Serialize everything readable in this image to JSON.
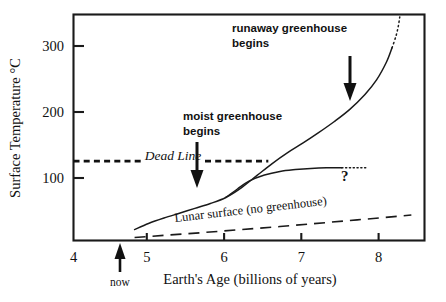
{
  "chart_data": {
    "type": "line",
    "title": "",
    "xlabel": "Earth's Age (billions of years)",
    "ylabel": "Surface Temperature °C",
    "xlim": [
      3.83,
      8.37
    ],
    "ylim": [
      -3,
      370
    ],
    "grid": false,
    "legend": "none",
    "xticks": [
      4,
      5,
      6,
      7,
      8
    ],
    "xticklabels": [
      "4",
      "5",
      "6",
      "7",
      "8"
    ],
    "yticks": [
      100,
      200,
      300
    ],
    "yticklabels": [
      "100",
      "200",
      "300"
    ],
    "series": [
      {
        "name": "Earth surface temperature (greenhouse)",
        "style": "solid",
        "points": [
          [
            4.62,
            15
          ],
          [
            4.8,
            25
          ],
          [
            5.0,
            34
          ],
          [
            5.2,
            42
          ],
          [
            5.4,
            50
          ],
          [
            5.6,
            58
          ],
          [
            5.8,
            68
          ],
          [
            6.0,
            84
          ],
          [
            6.2,
            104
          ],
          [
            6.4,
            124
          ],
          [
            6.6,
            142
          ],
          [
            6.8,
            158
          ],
          [
            7.0,
            175
          ],
          [
            7.2,
            193
          ],
          [
            7.4,
            213
          ],
          [
            7.6,
            238
          ],
          [
            7.75,
            262
          ],
          [
            7.88,
            292
          ],
          [
            7.95,
            315
          ]
        ]
      },
      {
        "name": "Earth surface temperature (runaway, extrapolated)",
        "style": "dotted",
        "points": [
          [
            7.95,
            315
          ],
          [
            8.0,
            334
          ],
          [
            8.03,
            350
          ],
          [
            8.05,
            366
          ]
        ]
      },
      {
        "name": "moist greenhouse branch (stabilized)",
        "style": "solid",
        "points": [
          [
            5.8,
            68
          ],
          [
            5.95,
            82
          ],
          [
            6.1,
            95
          ],
          [
            6.3,
            105
          ],
          [
            6.5,
            111
          ],
          [
            6.7,
            114
          ],
          [
            6.9,
            116
          ],
          [
            7.1,
            117
          ],
          [
            7.3,
            117
          ]
        ]
      },
      {
        "name": "moist greenhouse branch (uncertain)",
        "style": "dotted",
        "points": [
          [
            7.3,
            117
          ],
          [
            7.5,
            117
          ],
          [
            7.62,
            117
          ]
        ]
      },
      {
        "name": "Lunar surface (no greenhouse)",
        "style": "dashed",
        "points": [
          [
            4.62,
            2
          ],
          [
            5.5,
            10
          ],
          [
            6.5,
            20
          ],
          [
            7.5,
            31
          ],
          [
            8.2,
            39
          ]
        ]
      }
    ],
    "reference_lines": [
      {
        "name": "Dead Line",
        "label": "Dead Line",
        "orientation": "horizontal",
        "value": 128,
        "style": "dashed",
        "x_from": 3.83,
        "x_to": 6.35
      }
    ],
    "annotations": [
      {
        "name": "runaway-greenhouse-annotation",
        "line1": "runaway greenhouse",
        "line2": "begins",
        "arrow": "down",
        "target_x": 7.45,
        "target_y": 205
      },
      {
        "name": "moist-greenhouse-annotation",
        "line1": "moist greenhouse",
        "line2": "begins",
        "arrow": "down",
        "target_x": 5.82,
        "target_y": 72
      },
      {
        "name": "now-annotation",
        "label": "now",
        "arrow": "up",
        "target_x": 4.6
      },
      {
        "name": "lunar-surface-label",
        "label": "Lunar surface (no greenhouse)"
      },
      {
        "name": "question-mark-annotation",
        "label": "?"
      }
    ]
  }
}
